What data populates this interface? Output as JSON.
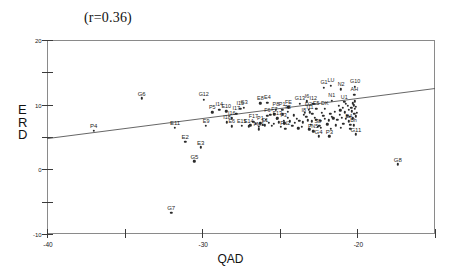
{
  "chart_data": {
    "type": "scatter",
    "title": "(r=0.36)",
    "xlabel": "QAD",
    "ylabel": "ERD",
    "xlim": [
      -40,
      10
    ],
    "ylim": [
      -40,
      20
    ],
    "xticks": [
      -40,
      -30,
      -20,
      -10,
      0,
      10
    ],
    "yticks": [
      -40,
      -30,
      -20,
      -10,
      0,
      10,
      20
    ],
    "xtick_labels": [
      "-40",
      "-30",
      "-20",
      "-10",
      "0",
      "10"
    ],
    "ytick_labels": [
      "-40",
      "-30",
      "-20",
      "-10",
      "0",
      "10",
      "20"
    ],
    "grid": false,
    "legend": null,
    "correlation": 0.36,
    "trendline": {
      "x0": -40,
      "y0": -10.5,
      "x1": 10,
      "y1": 5.0
    },
    "points": [
      {
        "label": "P4",
        "x": -34.0,
        "y": -8.0
      },
      {
        "label": "G6",
        "x": -27.8,
        "y": 2.0
      },
      {
        "label": "E11",
        "x": -23.5,
        "y": -7.2
      },
      {
        "label": "E2",
        "x": -22.2,
        "y": -11.5
      },
      {
        "label": "E3",
        "x": -20.2,
        "y": -13.2
      },
      {
        "label": "G5",
        "x": -21.0,
        "y": -17.5
      },
      {
        "label": "G7",
        "x": -24.0,
        "y": -33.5
      },
      {
        "label": "G12",
        "x": -19.8,
        "y": 1.5
      },
      {
        "label": "P5",
        "x": -18.7,
        "y": -2.4
      },
      {
        "label": "I14",
        "x": -17.8,
        "y": -1.6
      },
      {
        "label": "E10",
        "x": -16.9,
        "y": -2.1
      },
      {
        "label": "E9",
        "x": -19.5,
        "y": -6.6
      },
      {
        "label": "I16",
        "x": -16.2,
        "y": -4.2
      },
      {
        "label": "I18",
        "x": -16.8,
        "y": -5.4
      },
      {
        "label": "I17",
        "x": -15.6,
        "y": -2.8
      },
      {
        "label": "G3",
        "x": -14.6,
        "y": -0.9
      },
      {
        "label": "I15",
        "x": -15.1,
        "y": -1.3
      },
      {
        "label": "E6",
        "x": -16.2,
        "y": -6.7
      },
      {
        "label": "E15",
        "x": -14.9,
        "y": -6.6
      },
      {
        "label": "E14",
        "x": -14.0,
        "y": -6.7
      },
      {
        "label": "E8",
        "x": -12.5,
        "y": 0.4
      },
      {
        "label": "E4",
        "x": -11.6,
        "y": 0.6
      },
      {
        "label": "F17",
        "x": -13.4,
        "y": -5.3
      },
      {
        "label": "P1",
        "x": -12.5,
        "y": -5.8
      },
      {
        "label": "F6",
        "x": -11.6,
        "y": -3.5
      },
      {
        "label": "F7",
        "x": -10.7,
        "y": -3.0
      },
      {
        "label": "F13",
        "x": -10.3,
        "y": -4.2
      },
      {
        "label": "FM1",
        "x": -12.7,
        "y": -7.6
      },
      {
        "label": "E1",
        "x": -11.9,
        "y": -6.4
      },
      {
        "label": "P8",
        "x": -10.5,
        "y": -1.5
      },
      {
        "label": "P1b",
        "x": -9.7,
        "y": -1.6
      },
      {
        "label": "FE",
        "x": -8.9,
        "y": -0.8
      },
      {
        "label": "T8",
        "x": -9.0,
        "y": -2.3
      },
      {
        "label": "F3",
        "x": -9.5,
        "y": -5.0
      },
      {
        "label": "FN2",
        "x": -9.3,
        "y": -7.4
      },
      {
        "label": "G13",
        "x": -7.4,
        "y": 0.3
      },
      {
        "label": "I6",
        "x": -6.5,
        "y": 1.0
      },
      {
        "label": "I12",
        "x": -5.7,
        "y": 0.3
      },
      {
        "label": "D2",
        "x": -6.3,
        "y": -1.6
      },
      {
        "label": "I8",
        "x": -6.9,
        "y": -3.2
      },
      {
        "label": "I11",
        "x": -6.1,
        "y": -2.4
      },
      {
        "label": "E5",
        "x": -5.3,
        "y": -1.3
      },
      {
        "label": "DK",
        "x": -4.2,
        "y": -1.2
      },
      {
        "label": "N1",
        "x": -3.3,
        "y": 1.2
      },
      {
        "label": "G1",
        "x": -4.3,
        "y": 5.2
      },
      {
        "label": "LU",
        "x": -3.4,
        "y": 5.8
      },
      {
        "label": "N2",
        "x": -2.1,
        "y": 4.8
      },
      {
        "label": "G10",
        "x": -0.3,
        "y": 5.6
      },
      {
        "label": "AH",
        "x": -0.4,
        "y": 3.0
      },
      {
        "label": "U1",
        "x": -1.7,
        "y": 0.8
      },
      {
        "label": "B4",
        "x": -1.1,
        "y": -5.2
      },
      {
        "label": "Bh",
        "x": -0.5,
        "y": -6.4
      },
      {
        "label": "S8",
        "x": -5.1,
        "y": -6.8
      },
      {
        "label": "FN5",
        "x": -5.7,
        "y": -8.2
      },
      {
        "label": "G4",
        "x": -5.0,
        "y": -9.8
      },
      {
        "label": "P3",
        "x": -3.6,
        "y": -9.8
      },
      {
        "label": "G11",
        "x": -0.2,
        "y": -9.2
      },
      {
        "label": "G8",
        "x": 5.2,
        "y": -18.4
      }
    ],
    "cluster_points": [
      [
        -13.1,
        -5.9
      ],
      [
        -12.2,
        -6.2
      ],
      [
        -11.4,
        -5.6
      ],
      [
        -10.8,
        -6.0
      ],
      [
        -10.1,
        -5.5
      ],
      [
        -9.4,
        -5.8
      ],
      [
        -8.7,
        -5.2
      ],
      [
        -8.1,
        -5.6
      ],
      [
        -7.5,
        -5.0
      ],
      [
        -7.0,
        -5.4
      ],
      [
        -6.4,
        -4.8
      ],
      [
        -5.9,
        -5.2
      ],
      [
        -5.3,
        -4.6
      ],
      [
        -4.8,
        -5.0
      ],
      [
        -4.2,
        -4.4
      ],
      [
        -3.7,
        -4.8
      ],
      [
        -3.1,
        -4.2
      ],
      [
        -2.6,
        -4.6
      ],
      [
        -2.0,
        -4.0
      ],
      [
        -1.5,
        -4.4
      ],
      [
        -1.0,
        -3.8
      ],
      [
        -0.6,
        -4.2
      ],
      [
        -0.2,
        -3.6
      ],
      [
        -13.8,
        -6.4
      ],
      [
        -12.7,
        -6.8
      ],
      [
        -11.0,
        -6.6
      ],
      [
        -9.9,
        -6.9
      ],
      [
        -8.4,
        -6.5
      ],
      [
        -7.2,
        -6.8
      ],
      [
        -6.0,
        -6.3
      ],
      [
        -4.9,
        -6.6
      ],
      [
        -3.9,
        -6.1
      ],
      [
        -2.8,
        -6.4
      ],
      [
        -1.8,
        -5.9
      ],
      [
        -0.9,
        -6.2
      ],
      [
        -11.8,
        -4.6
      ],
      [
        -10.4,
        -4.3
      ],
      [
        -9.0,
        -4.0
      ],
      [
        -7.8,
        -4.3
      ],
      [
        -6.6,
        -3.7
      ],
      [
        -5.5,
        -4.0
      ],
      [
        -4.4,
        -3.4
      ],
      [
        -3.3,
        -3.7
      ],
      [
        -2.3,
        -3.1
      ],
      [
        -1.3,
        -3.4
      ],
      [
        -0.4,
        -2.9
      ],
      [
        -2.9,
        -2.3
      ],
      [
        -2.2,
        -1.8
      ],
      [
        -1.6,
        -2.4
      ],
      [
        -1.1,
        -1.5
      ],
      [
        -0.7,
        -2.0
      ],
      [
        -0.3,
        -1.2
      ],
      [
        -0.1,
        -2.6
      ],
      [
        -1.9,
        -0.9
      ],
      [
        -1.2,
        -0.4
      ],
      [
        -0.8,
        -0.9
      ],
      [
        -0.5,
        -0.2
      ],
      [
        -0.2,
        -0.7
      ],
      [
        -0.6,
        0.4
      ],
      [
        -0.3,
        1.1
      ],
      [
        -1.5,
        0.2
      ],
      [
        -2.4,
        -0.3
      ],
      [
        -6.8,
        -2.6
      ],
      [
        -5.8,
        -2.9
      ],
      [
        -4.6,
        -2.5
      ],
      [
        -3.5,
        -2.8
      ],
      [
        -8.2,
        -3.3
      ],
      [
        -9.6,
        -3.0
      ],
      [
        -11.2,
        -3.2
      ],
      [
        -0.9,
        -7.4
      ],
      [
        -2.1,
        -7.1
      ],
      [
        -3.4,
        -7.5
      ],
      [
        -4.7,
        -7.2
      ],
      [
        -6.2,
        -7.6
      ],
      [
        -7.6,
        -7.3
      ]
    ]
  }
}
